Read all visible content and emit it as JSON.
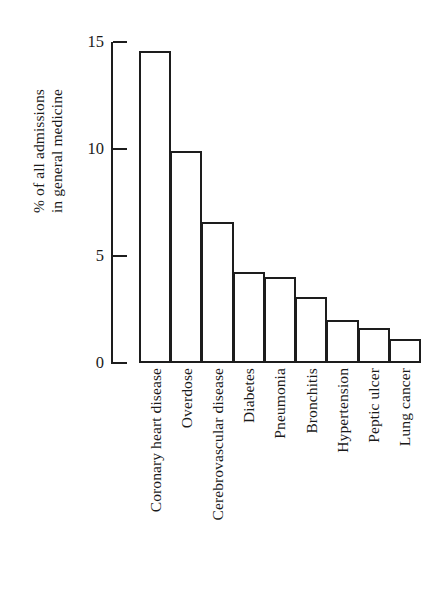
{
  "figure": {
    "background_color": "#ffffff",
    "ink_color": "#1d1d1d"
  },
  "chart_data": {
    "type": "bar",
    "title": "",
    "subtitle": "",
    "xlabel": "",
    "ylabel": "% of all admissions in general medicine",
    "ylabel_lines": [
      "% of all admissions",
      "in general medicine"
    ],
    "categories": [
      "Coronary heart disease",
      "Overdose",
      "Cerebrovascular disease",
      "Diabetes",
      "Pneumonia",
      "Bronchitis",
      "Hypertension",
      "Peptic ulcer",
      "Lung cancer"
    ],
    "values": [
      14.6,
      9.9,
      6.6,
      4.25,
      4.0,
      3.1,
      2.0,
      1.65,
      1.1
    ],
    "ylim": [
      0,
      15
    ],
    "yticks": [
      0,
      5,
      10,
      15
    ],
    "ytick_labels": [
      "0",
      "5",
      "10",
      "15"
    ],
    "xticks": [],
    "grid": false,
    "legend": null,
    "bar_style": {
      "fill": "none",
      "edge_color": "#1d1d1d",
      "edge_width": 2,
      "gap": 0
    },
    "annotations": []
  }
}
